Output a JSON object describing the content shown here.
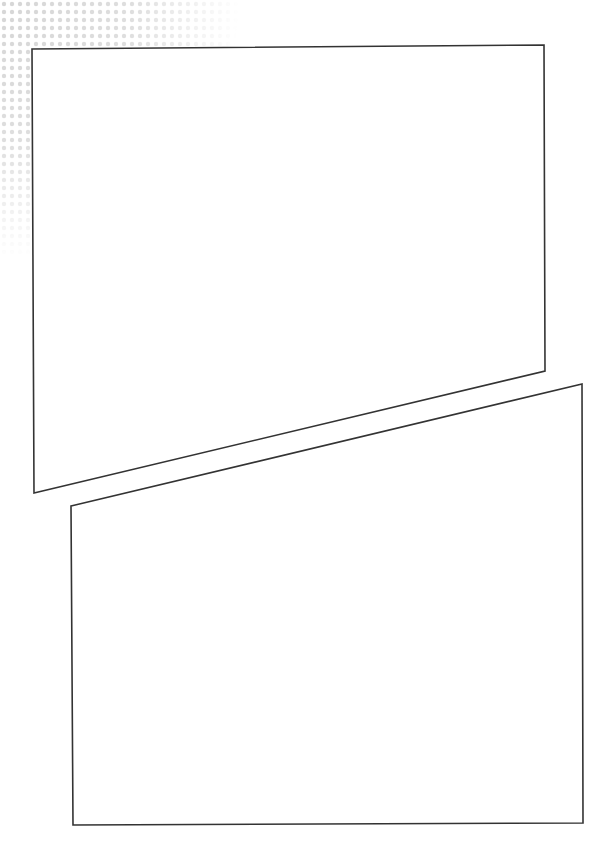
{
  "page": {
    "width": 612,
    "height": 845,
    "background": "#ffffff",
    "halftone": {
      "corner": "top-left",
      "color": "#d9d9d9",
      "extent_x": 190,
      "extent_y": 240
    },
    "panels": [
      {
        "id": "panel-1",
        "points": "32,49 544,45 545,371 34,493",
        "fill": "#ffffff",
        "stroke": "#333333"
      },
      {
        "id": "panel-2",
        "points": "71,506 582,384 583,823 73,825",
        "fill": "#ffffff",
        "stroke": "#333333"
      }
    ]
  }
}
